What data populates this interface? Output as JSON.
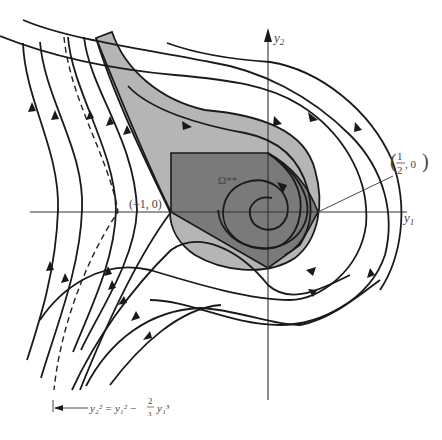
{
  "figure": {
    "type": "phase-portrait",
    "axes": {
      "x_label": "y",
      "x_sub": "1",
      "y_label": "y",
      "y_sub": "2"
    },
    "regions": {
      "outer_region_fill": "#b5b5b5",
      "inner_region_label": "Ω**",
      "inner_region_fill": "#7a7a7a"
    },
    "points": {
      "saddle_label": "(−1, 0)",
      "right_point_label_num": "1",
      "right_point_label_den": "2",
      "right_point_label_rest": ", 0"
    },
    "separatrix": {
      "equation_lhs": "y₂² = y₁² −",
      "fraction_num": "2",
      "fraction_den": "3",
      "equation_tail": "y₁³"
    }
  }
}
